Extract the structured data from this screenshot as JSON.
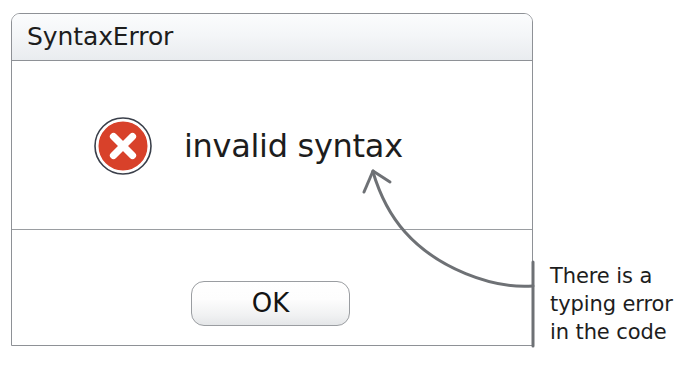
{
  "dialog": {
    "title": "SyntaxError",
    "message": "invalid syntax",
    "icon": "error-cross-circle-icon",
    "icon_color": "#d8412a",
    "buttons": [
      {
        "label": "OK",
        "name": "ok-button"
      }
    ],
    "titlebar_color": "#f4f6f8",
    "border_color": "#8e9196",
    "text_color": "#1d1d1d"
  },
  "annotation": {
    "lines": [
      "There is a",
      "typing error",
      "in the code"
    ],
    "line1": "There is a",
    "line2": "typing error",
    "line3": "in the code",
    "arrow": "curved-arrow-pointing-to-message",
    "color": "#6e7175"
  }
}
